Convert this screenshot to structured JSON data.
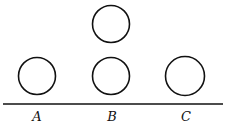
{
  "diagram": {
    "stroke_color": "#111111",
    "circles": [
      {
        "id": "A",
        "cx": 37,
        "cy": 76,
        "r": 18.5
      },
      {
        "id": "B-top",
        "cx": 111,
        "cy": 24,
        "r": 18.5
      },
      {
        "id": "B-bottom",
        "cx": 111,
        "cy": 76,
        "r": 18.5
      },
      {
        "id": "C",
        "cx": 185,
        "cy": 76,
        "r": 19.5
      }
    ],
    "baseline": {
      "x1": 3,
      "y1": 104,
      "x2": 223,
      "y2": 104
    },
    "labels": [
      {
        "text": "A",
        "x": 37
      },
      {
        "text": "B",
        "x": 112
      },
      {
        "text": "C",
        "x": 186
      }
    ]
  }
}
